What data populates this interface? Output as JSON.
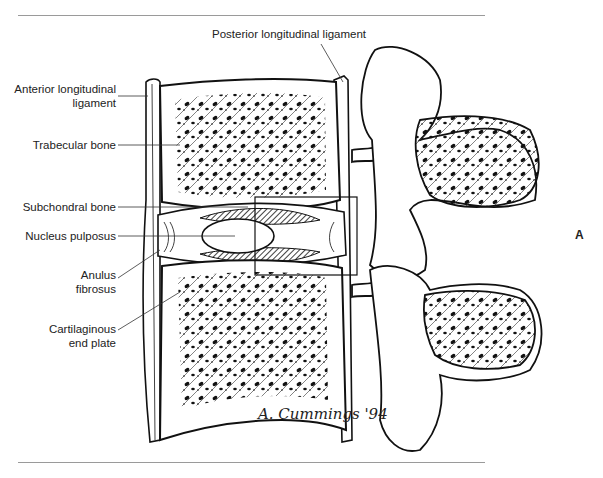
{
  "figure": {
    "panel_letter": "A",
    "signature": "A. Cummings '94",
    "labels": {
      "posterior_longitudinal_ligament": "Posterior longitudinal ligament",
      "anterior_longitudinal_ligament_line1": "Anterior longitudinal",
      "anterior_longitudinal_ligament_line2": "ligament",
      "trabecular_bone": "Trabecular bone",
      "subchondral_bone": "Subchondral bone",
      "nucleus_pulposus": "Nucleus pulposus",
      "anulus_fibrosus_line1": "Anulus",
      "anulus_fibrosus_line2": "fibrosus",
      "cartilaginous_end_plate_line1": "Cartilaginous",
      "cartilaginous_end_plate_line2": "end plate"
    },
    "colors": {
      "ink": "#111111",
      "rule": "#9a9a9a",
      "background": "#ffffff"
    }
  }
}
